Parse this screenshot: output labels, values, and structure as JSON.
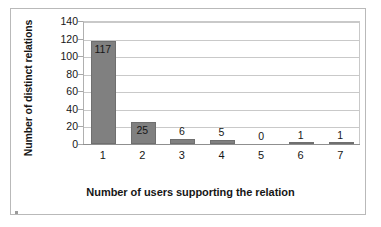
{
  "chart_data": {
    "type": "bar",
    "title": "",
    "xlabel": "Number of users supporting the relation",
    "ylabel": "Number of distinct relations",
    "categories": [
      "1",
      "2",
      "3",
      "4",
      "5",
      "6",
      "7"
    ],
    "values": [
      117,
      25,
      6,
      5,
      0,
      1,
      1
    ],
    "data_labels": [
      "117",
      "25",
      "6",
      "5",
      "0",
      "1",
      "1"
    ],
    "series": [
      {
        "name": "Number of distinct relations",
        "values": [
          117,
          25,
          6,
          5,
          0,
          1,
          1
        ],
        "color": "#808080"
      }
    ],
    "yticks": [
      140,
      120,
      100,
      80,
      60,
      40,
      20,
      0
    ],
    "ytick_labels": [
      "140",
      "120",
      "100",
      "80",
      "60",
      "40",
      "20",
      "0"
    ],
    "ylim": [
      0,
      140
    ],
    "grid": true,
    "grid_axis": "y",
    "legend": false,
    "legend_position": "none",
    "bar_color": "#808080",
    "gridline_color": "#c9c9c9",
    "axis_color": "#8f8f8f",
    "background": "#ffffff"
  }
}
